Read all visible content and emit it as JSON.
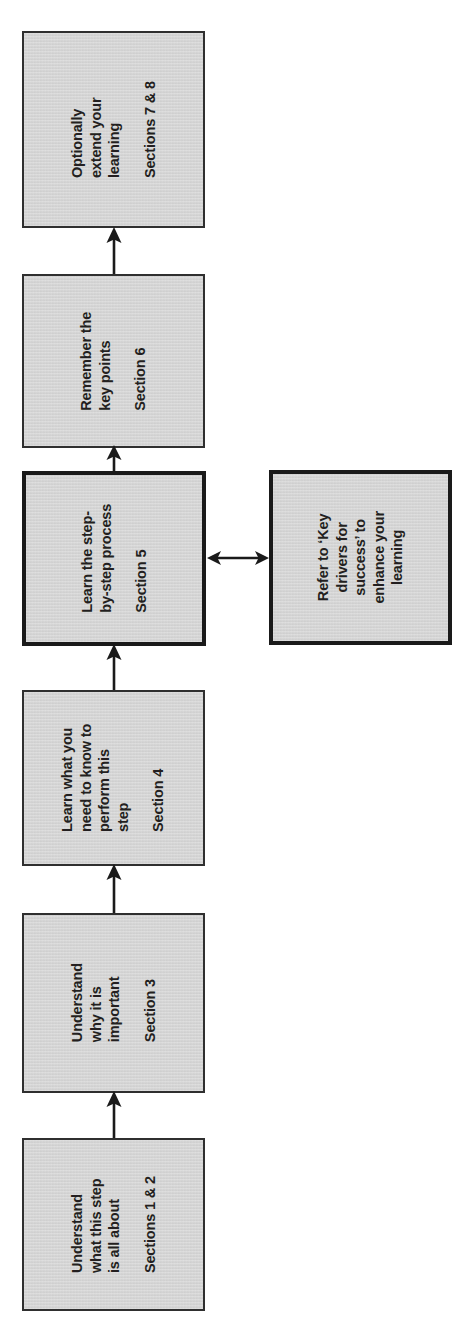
{
  "diagram": {
    "orientation": "rotated-90",
    "fill_color": "#d4d4d4",
    "line_color": "#2f2f2f",
    "text_color": "#231f20"
  },
  "boxes": [
    {
      "id": "step-1",
      "title": "Understand\nwhat this step\nis all about",
      "title_lines": [
        "Understand",
        "what this step",
        "is all about"
      ],
      "section": "Sections 1 & 2",
      "emphasis": false
    },
    {
      "id": "step-2",
      "title": "Understand\nwhy it is\nimportant",
      "title_lines": [
        "Understand",
        "why it is",
        "important"
      ],
      "section": "Section 3",
      "emphasis": false
    },
    {
      "id": "step-3",
      "title": "Learn what you\nneed to know to\nperform this\nstep",
      "title_lines": [
        "Learn what you",
        "need to know to",
        "perform this",
        "step"
      ],
      "section": "Section 4",
      "emphasis": false
    },
    {
      "id": "step-4",
      "title": "Learn the step-\nby-step process",
      "title_lines": [
        "Learn the step-",
        "by-step process"
      ],
      "section": "Section 5",
      "emphasis": true
    },
    {
      "id": "step-5",
      "title": "Remember the\nkey points",
      "title_lines": [
        "Remember the",
        "key points"
      ],
      "section": "Section 6",
      "emphasis": false
    },
    {
      "id": "step-6",
      "title": "Optionally\nextend your\nlearning",
      "title_lines": [
        "Optionally",
        "extend your",
        "learning"
      ],
      "section": "Sections 7 & 8",
      "emphasis": false
    }
  ],
  "side_box": {
    "id": "side-note",
    "title_lines": [
      "Refer to ‘Key",
      "drivers for",
      "success’ to",
      "enhance your",
      "learning"
    ],
    "emphasis": true
  },
  "connectors": [
    {
      "id": "arrow-1-to-2",
      "type": "single-arrow-up",
      "from": "step-1",
      "to": "step-2"
    },
    {
      "id": "arrow-2-to-3",
      "type": "single-arrow-up",
      "from": "step-2",
      "to": "step-3"
    },
    {
      "id": "arrow-3-to-4",
      "type": "single-arrow-up",
      "from": "step-3",
      "to": "step-4"
    },
    {
      "id": "arrow-4-to-5",
      "type": "single-arrow-up",
      "from": "step-4",
      "to": "step-5"
    },
    {
      "id": "arrow-5-to-6",
      "type": "single-arrow-up",
      "from": "step-5",
      "to": "step-6"
    },
    {
      "id": "arrow-4-to-side",
      "type": "double-arrow",
      "from": "step-4",
      "to": "side-note"
    }
  ]
}
